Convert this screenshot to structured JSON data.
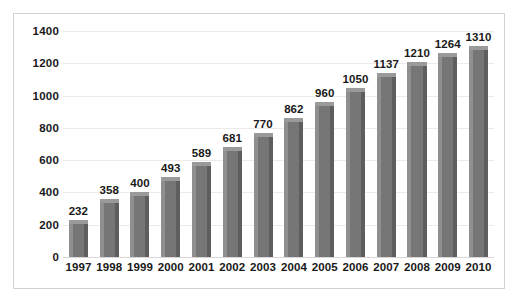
{
  "chart_data": {
    "type": "bar",
    "title": "",
    "subtitle": "",
    "xlabel": "",
    "ylabel": "",
    "categories": [
      "1997",
      "1998",
      "1999",
      "2000",
      "2001",
      "2002",
      "2003",
      "2004",
      "2005",
      "2006",
      "2007",
      "2008",
      "2009",
      "2010"
    ],
    "values": [
      232,
      358,
      400,
      493,
      589,
      681,
      770,
      862,
      960,
      1050,
      1137,
      1210,
      1264,
      1310
    ],
    "data_labels": [
      "232",
      "358",
      "400",
      "493",
      "589",
      "681",
      "770",
      "862",
      "960",
      "1050",
      "1137",
      "1210",
      "1264",
      "1310"
    ],
    "ylim": [
      0,
      1400
    ],
    "yticks": [
      0,
      200,
      400,
      600,
      800,
      1000,
      1200,
      1400
    ],
    "ytick_labels": [
      "0",
      "200",
      "400",
      "600",
      "800",
      "1000",
      "1200",
      "1400"
    ],
    "grid": true,
    "grid_axis": "y",
    "legend": false,
    "legend_position": "none",
    "series": [
      {
        "name": "",
        "values": [
          232,
          358,
          400,
          493,
          589,
          681,
          770,
          862,
          960,
          1050,
          1137,
          1210,
          1264,
          1310
        ]
      }
    ],
    "colors": {
      "bar_front": "#767676",
      "bar_top": "#9a9a9a",
      "bar_side_dark": "#5e5e5e",
      "bar_side_light": "#8f8f8f",
      "gridline": "#eceaea",
      "axis_line": "#d8d6d6",
      "frame_border": "#d2d2d2",
      "text": "#191919",
      "background": "#ffffff"
    }
  }
}
